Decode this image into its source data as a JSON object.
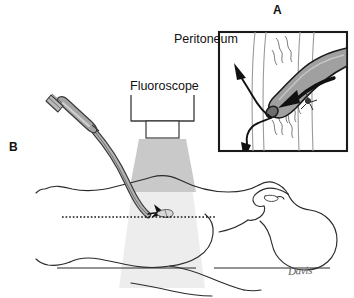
{
  "figure": {
    "width": 354,
    "height": 298,
    "background": "#ffffff"
  },
  "labels": {
    "panel_a": "A",
    "panel_b": "B",
    "peritoneum": "Peritoneum",
    "fluoroscope": "Fluoroscope",
    "signature": "Davis"
  },
  "colors": {
    "ink": "#111111",
    "outline": "#2b2b2b",
    "instrument_fill": "#9d9d9d",
    "instrument_fill_light": "#b9b9b9",
    "instrument_stroke": "#3a3a3a",
    "beam_upper": "#c9c9c9",
    "beam_lower": "#ededed",
    "anatomy_line": "#6f6f6f",
    "signature": "#5d5d5d",
    "box_border": "#1a1a1a"
  },
  "panel_a": {
    "name": "inset-detail-view",
    "box": {
      "x": 218,
      "y": 31,
      "width": 130,
      "height": 121
    },
    "description": "Close-up cross-section of abdominal wall layers with instrument tip passing through the peritoneum",
    "annotations": [
      {
        "name": "peritoneum-leader-line",
        "label": "Peritoneum"
      },
      {
        "name": "insertion-direction-arrow",
        "label": "instrument advance direction"
      },
      {
        "name": "reflux-arrow-up",
        "label": "upward flow"
      },
      {
        "name": "reflux-arrow-down",
        "label": "downward flow"
      }
    ]
  },
  "panel_b": {
    "name": "overview-patient-view",
    "description": "Supine patient with fluoroscope positioned over the abdomen and endoscope inserted at the puncture site",
    "elements": [
      {
        "name": "fluoroscope-housing",
        "label": "Fluoroscope"
      },
      {
        "name": "fluoroscope-collimator",
        "label": "collimator"
      },
      {
        "name": "fluoroscope-beam",
        "label": "x-ray beam"
      },
      {
        "name": "endoscope-handle",
        "label": "endoscope handle"
      },
      {
        "name": "endoscope-tube",
        "label": "flexible insertion tube"
      },
      {
        "name": "puncture-site-marker",
        "label": "puncture site"
      },
      {
        "name": "reference-dotted-line",
        "label": "horizontal reference plane"
      },
      {
        "name": "patient-body-outline",
        "label": "patient"
      },
      {
        "name": "table-line",
        "label": "procedure table"
      }
    ]
  }
}
